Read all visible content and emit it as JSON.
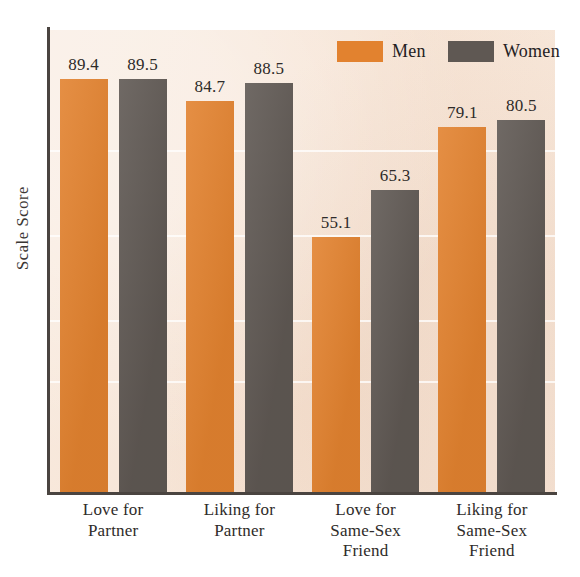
{
  "chart_data": {
    "type": "bar",
    "title": "",
    "subtitle": "",
    "xlabel": "",
    "ylabel": "Scale Score",
    "ylim": [
      0,
      100
    ],
    "grid": true,
    "legend_position": "top-right",
    "categories": [
      "Love for Partner",
      "Liking for Partner",
      "Love for Same-Sex Friend",
      "Liking for Same-Sex Friend"
    ],
    "category_lines": [
      [
        "Love for",
        "Partner"
      ],
      [
        "Liking for",
        "Partner"
      ],
      [
        "Love for",
        "Same-Sex",
        "Friend"
      ],
      [
        "Liking for",
        "Same-Sex",
        "Friend"
      ]
    ],
    "series": [
      {
        "name": "Men",
        "color": "#e2822f",
        "values": [
          89.4,
          84.7,
          55.1,
          79.1
        ]
      },
      {
        "name": "Women",
        "color": "#5f5853",
        "values": [
          89.5,
          88.5,
          65.3,
          80.5
        ]
      }
    ],
    "value_labels": [
      "89.4",
      "89.5",
      "84.7",
      "88.5",
      "55.1",
      "65.3",
      "79.1",
      "80.5"
    ]
  },
  "legend": {
    "items": [
      {
        "label": "Men",
        "swatch": "men-color-swatch"
      },
      {
        "label": "Women",
        "swatch": "women-color-swatch"
      }
    ]
  },
  "axes": {
    "y_title": "Scale Score"
  },
  "colors": {
    "men": "#e2822f",
    "women": "#5f5853",
    "plot_background": "#f7e6d8",
    "axis": "#4a4440",
    "gridline": "#ffffff",
    "text": "#2e2b29"
  }
}
